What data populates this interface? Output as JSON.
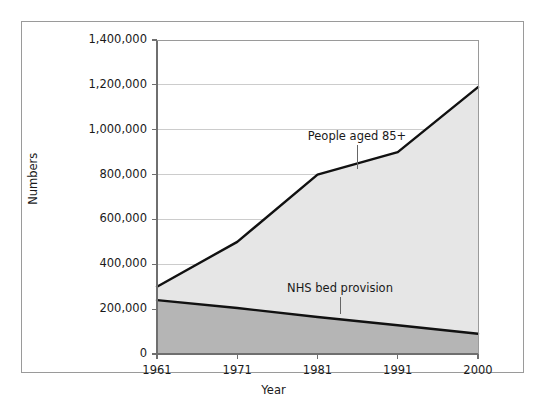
{
  "figure": {
    "background": "#ffffff",
    "border_color": "#9a9a9a"
  },
  "axis_titles": {
    "y": "Numbers",
    "x": "Year"
  },
  "annotations": {
    "upper": "People aged 85+",
    "lower": "NHS bed provision"
  },
  "chart_data": {
    "type": "area",
    "title": "",
    "subtitle": "",
    "xlabel": "Year",
    "ylabel": "Numbers",
    "x": [
      1961,
      1971,
      1981,
      1991,
      2000
    ],
    "categories": [
      "1961",
      "1971",
      "1981",
      "1991",
      "2000"
    ],
    "xtick_labels": [
      "1961",
      "1971",
      "1981",
      "1991",
      "2000"
    ],
    "ytick_labels": [
      "0",
      "200,000",
      "400,000",
      "600,000",
      "800,000",
      "1,000,000",
      "1,200,000",
      "1,400,000"
    ],
    "ytick_values": [
      0,
      200000,
      400000,
      600000,
      800000,
      1000000,
      1200000,
      1400000
    ],
    "ylim": [
      0,
      1400000
    ],
    "xlim": [
      1961,
      2000
    ],
    "grid": "horizontal",
    "grid_color": "#cccccc",
    "legend": "none",
    "legend_position": "inline-annotations",
    "series": [
      {
        "name": "People aged 85+",
        "values": [
          300000,
          500000,
          800000,
          900000,
          1190000
        ],
        "fill_color": "#e6e6e6",
        "line_color": "#111111",
        "annotation": "People aged 85+"
      },
      {
        "name": "NHS bed provision",
        "values": [
          240000,
          205000,
          165000,
          128000,
          90000
        ],
        "fill_color": "#b5b5b5",
        "line_color": "#111111",
        "annotation": "NHS bed provision"
      }
    ]
  }
}
